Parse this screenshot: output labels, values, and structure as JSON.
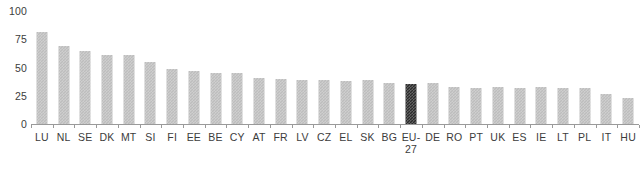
{
  "chart_data": {
    "type": "bar",
    "title": "",
    "subtitle": "",
    "xlabel": "",
    "ylabel": "",
    "ylim": [
      0,
      100
    ],
    "y_ticks": [
      0,
      25,
      50,
      75,
      100
    ],
    "grid": false,
    "legend": "none",
    "highlight_category": "EU-27",
    "colors": {
      "bar": "#bdbdbd",
      "highlight_bar": "#2b2b2b",
      "axis": "#9a9a9a",
      "text": "#3c3c3c",
      "background": "#ffffff"
    },
    "categories": [
      "LU",
      "NL",
      "SE",
      "DK",
      "MT",
      "SI",
      "FI",
      "EE",
      "BE",
      "CY",
      "AT",
      "FR",
      "LV",
      "CZ",
      "EL",
      "SK",
      "BG",
      "EU-\n27",
      "DE",
      "RO",
      "PT",
      "UK",
      "ES",
      "IE",
      "LT",
      "PL",
      "IT",
      "HU"
    ],
    "values": [
      81,
      69,
      65,
      61,
      61,
      55,
      49,
      47,
      45,
      45,
      41,
      40,
      39,
      39,
      38,
      39,
      36,
      35,
      36,
      33,
      32,
      33,
      32,
      33,
      32,
      32,
      27,
      23
    ]
  }
}
